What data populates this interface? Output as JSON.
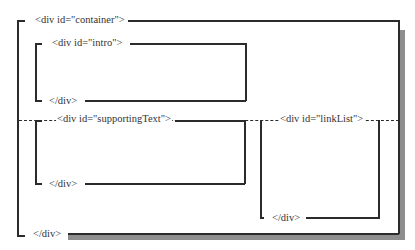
{
  "diagram": {
    "colors": {
      "line": "#2b2b2b",
      "shadow": "#8e8e8e",
      "background": "#ffffff"
    },
    "container": {
      "open_tag": "<div id=\"container\">",
      "close_tag": "</div>"
    },
    "intro": {
      "open_tag": "<div id=\"intro\">",
      "close_tag": "</div>"
    },
    "supportingText": {
      "open_tag": "<div id=\"supportingText\">",
      "close_tag": "</div>"
    },
    "linkList": {
      "open_tag": "<div id=\"linkList\">",
      "close_tag": "</div>"
    },
    "divider": {
      "style": "dashed"
    }
  }
}
